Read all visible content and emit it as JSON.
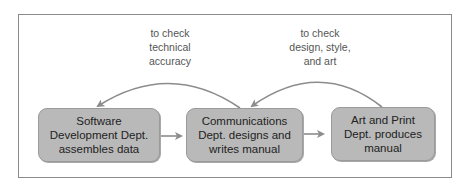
{
  "diagram": {
    "nodes": [
      {
        "id": "software",
        "label": "Software\nDevelopment Dept.\nassembles data"
      },
      {
        "id": "communications",
        "label": "Communications\nDept. designs and\nwrites manual"
      },
      {
        "id": "artprint",
        "label": "Art and Print\nDept. produces\nmanual"
      }
    ],
    "feedback_labels": [
      {
        "from": "communications",
        "to": "software",
        "label": "to check\ntechnical\naccuracy"
      },
      {
        "from": "artprint",
        "to": "communications",
        "label": "to check\ndesign, style,\nand art"
      }
    ],
    "forward_edges": [
      {
        "from": "software",
        "to": "communications"
      },
      {
        "from": "communications",
        "to": "artprint"
      }
    ],
    "colors": {
      "box_fill": "#b9b9b9",
      "arrow": "#8c8c8c",
      "frame": "#8a8a8a",
      "label_text": "#555555"
    }
  }
}
